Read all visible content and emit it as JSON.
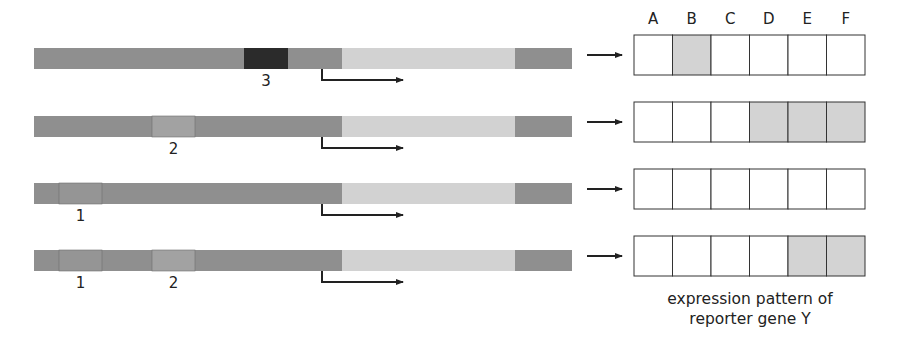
{
  "colors": {
    "background": "#ffffff",
    "bar_dark": "#8f8f8f",
    "bar_light": "#d2d2d2",
    "element_1": "#959595",
    "element_2": "#a2a2a2",
    "element_3": "#2b2b2b",
    "cell_on": "#d3d3d3",
    "cell_off": "#ffffff",
    "line": "#222222"
  },
  "columns": [
    "A",
    "B",
    "C",
    "D",
    "E",
    "F"
  ],
  "constructs": [
    {
      "elements": [
        "3"
      ],
      "labels": [
        "3"
      ],
      "expression": [
        false,
        true,
        false,
        false,
        false,
        false
      ]
    },
    {
      "elements": [
        "2"
      ],
      "labels": [
        "2"
      ],
      "expression": [
        false,
        false,
        false,
        true,
        true,
        true
      ]
    },
    {
      "elements": [
        "1"
      ],
      "labels": [
        "1"
      ],
      "expression": [
        false,
        false,
        false,
        false,
        false,
        false
      ]
    },
    {
      "elements": [
        "1",
        "2"
      ],
      "labels": [
        "1",
        "2"
      ],
      "expression": [
        false,
        false,
        false,
        false,
        true,
        true
      ]
    }
  ],
  "caption": {
    "line1": "expression pattern of",
    "line2": "reporter gene Y"
  }
}
